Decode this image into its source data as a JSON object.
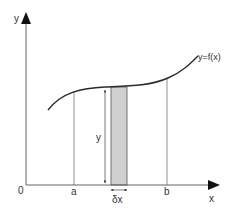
{
  "diagram": {
    "labels": {
      "y_axis": "y",
      "x_axis": "x",
      "origin": "0",
      "a": "a",
      "b": "b",
      "curve": "y=f(x)",
      "strip_height": "y",
      "strip_width": "δx"
    },
    "colors": {
      "line": "#333333",
      "curve": "#2a2a2a",
      "strip_fill": "#d0d0d0",
      "thin_line": "#777777"
    }
  }
}
